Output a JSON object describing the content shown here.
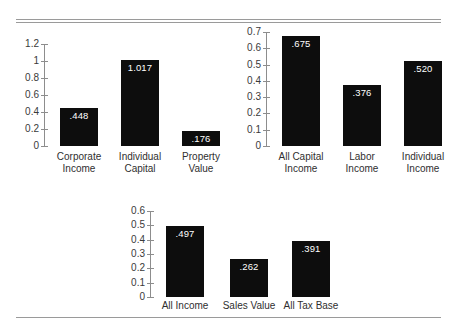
{
  "figure": {
    "background_color": "#ffffff",
    "bar_color": "#0d0d0d",
    "value_label_color": "#ffffff",
    "rule_color": "#9a9a9a",
    "axis_color": "#8d8d8d"
  },
  "chart_data": [
    {
      "type": "bar",
      "id": "chart-top-left",
      "title": "",
      "xlabel": "",
      "ylabel": "",
      "categories": [
        "Corporate\nIncome",
        "Individual\nCapital",
        "Property\nValue"
      ],
      "values": [
        0.448,
        1.017,
        0.176
      ],
      "value_labels": [
        ".448",
        "1.017",
        ".176"
      ],
      "ylim": [
        0,
        1.2
      ],
      "yticks": [
        0,
        0.2,
        0.4,
        0.6,
        0.8,
        1,
        1.2
      ],
      "ytick_labels": [
        "0",
        "0.2",
        "0.4",
        "0.6",
        "0.8",
        "1",
        "1.2"
      ],
      "grid": false,
      "legend": "none"
    },
    {
      "type": "bar",
      "id": "chart-top-right",
      "title": "",
      "xlabel": "",
      "ylabel": "",
      "categories": [
        "All Capital\nIncome",
        "Labor\nIncome",
        "Individual\nIncome"
      ],
      "values": [
        0.675,
        0.376,
        0.52
      ],
      "value_labels": [
        ".675",
        ".376",
        ".520"
      ],
      "ylim": [
        0,
        0.7
      ],
      "yticks": [
        0,
        0.1,
        0.2,
        0.3,
        0.4,
        0.5,
        0.6,
        0.7
      ],
      "ytick_labels": [
        "0",
        "0.1",
        "0.2",
        "0.3",
        "0.4",
        "0.5",
        "0.6",
        "0.7"
      ],
      "grid": false,
      "legend": "none"
    },
    {
      "type": "bar",
      "id": "chart-bottom",
      "title": "",
      "xlabel": "",
      "ylabel": "",
      "categories": [
        "All Income",
        "Sales Value",
        "All Tax Base"
      ],
      "values": [
        0.497,
        0.262,
        0.391
      ],
      "value_labels": [
        ".497",
        ".262",
        ".391"
      ],
      "ylim": [
        0,
        0.6
      ],
      "yticks": [
        0,
        0.1,
        0.2,
        0.3,
        0.4,
        0.5,
        0.6
      ],
      "ytick_labels": [
        "0",
        "0.1",
        "0.2",
        "0.3",
        "0.4",
        "0.5",
        "0.6"
      ],
      "grid": false,
      "legend": "none"
    }
  ]
}
